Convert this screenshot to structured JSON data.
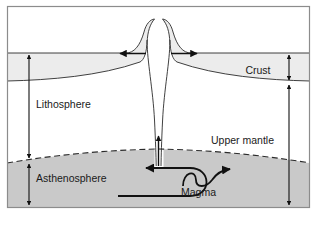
{
  "figure": {
    "type": "cross-section-diagram",
    "frame_border_color": "#8c8c8c",
    "background_color": "#ffffff"
  },
  "layers": [
    {
      "key": "crust",
      "label": "Crust",
      "fill": "#ececec",
      "stroke": "#2b2b2b"
    },
    {
      "key": "lithosphere",
      "label": "Lithosphere",
      "fill": "#ffffff",
      "stroke": "#2b2b2b"
    },
    {
      "key": "upper_mantle",
      "label": "Upper mantle",
      "fill": "#ffffff",
      "stroke": "#2b2b2b"
    },
    {
      "key": "asthenosphere",
      "label": "Asthenosphere",
      "fill": "#c9c9c9",
      "stroke": "#2b2b2b"
    }
  ],
  "labels": {
    "crust": "Crust",
    "lithosphere": "Lithosphere",
    "upper_mantle": "Upper mantle",
    "asthenosphere": "Asthenosphere",
    "magma": "Magma"
  },
  "annotations": {
    "spreading_left_arrow": "spreading-direction-left",
    "spreading_right_arrow": "spreading-direction-right",
    "magma_rise_arrow": "magma-upwelling-arrow",
    "convection_left_arrow": "convection-flow-left",
    "convection_right_arrow": "convection-flow-right",
    "crust_thickness_arrow": "crust-thickness-measure",
    "lithosphere_thickness_arrow": "lithosphere-thickness-measure",
    "asthenosphere_thickness_arrow": "asthenosphere-thickness-measure",
    "upper_mantle_thickness_arrow": "upper-mantle-thickness-measure"
  },
  "boundaries": {
    "moho_style": "solid",
    "lithosphere_asthenosphere_style": "dashed"
  },
  "caption": ""
}
